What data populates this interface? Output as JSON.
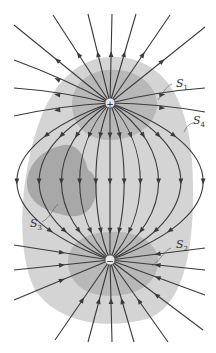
{
  "diagram": {
    "charges": [
      {
        "id": "positive",
        "sign": "+",
        "x": 110,
        "y": 103
      },
      {
        "id": "negative",
        "sign": "−",
        "x": 110,
        "y": 260
      }
    ],
    "surfaces": [
      {
        "id": "S1",
        "label": "S",
        "subscript": "1",
        "color": "#b4b4b4"
      },
      {
        "id": "S2",
        "label": "S",
        "subscript": "2",
        "color": "#b4b4b4"
      },
      {
        "id": "S3",
        "label": "S",
        "subscript": "3",
        "color": "#a6a6a6"
      },
      {
        "id": "S4",
        "label": "S",
        "subscript": "4",
        "color": "#d4d4d4"
      }
    ],
    "colors": {
      "field_line": "#3a3a3a",
      "s4_fill": "#d4d4d4",
      "inner_fill": "#b4b4b4",
      "s3_fill": "#a6a6a6",
      "background": "#ffffff"
    }
  }
}
